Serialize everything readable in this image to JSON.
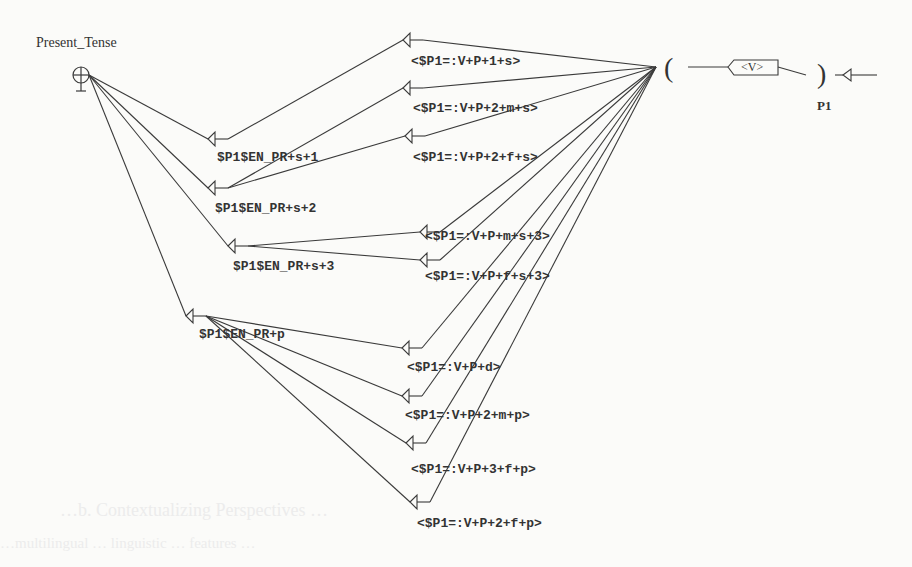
{
  "graph": {
    "title": "Present_Tense",
    "initial_node": {
      "x": 81,
      "y": 75
    },
    "convergence_node": {
      "x": 656,
      "y": 67
    },
    "left_nodes": [
      {
        "id": "s1",
        "label": "$P1$EN_PR+s+1",
        "tip": [
          208,
          139
        ],
        "label_pos": [
          217,
          150
        ]
      },
      {
        "id": "s2",
        "label": "$P1$EN_PR+s+2",
        "tip": [
          208,
          188
        ],
        "label_pos": [
          215,
          201
        ]
      },
      {
        "id": "s3",
        "label": "$P1$EN_PR+s+3",
        "tip": [
          228,
          246
        ],
        "label_pos": [
          233,
          259
        ]
      },
      {
        "id": "p",
        "label": "$P1$EN_PR+p",
        "tip": [
          186,
          316
        ],
        "label_pos": [
          199,
          327
        ]
      }
    ],
    "right_nodes": [
      {
        "id": "r1",
        "label": "<$P1=:V+P+1+s>",
        "from": "s1",
        "tip": [
          403,
          40
        ],
        "label_pos": [
          411,
          54
        ]
      },
      {
        "id": "r2",
        "label": "<$P1=:V+P+2+m+s>",
        "from": "s2",
        "tip": [
          403,
          88
        ],
        "label_pos": [
          413,
          101
        ]
      },
      {
        "id": "r3",
        "label": "<$P1=:V+P+2+f+s>",
        "from": "s2",
        "tip": [
          405,
          136
        ],
        "label_pos": [
          413,
          150
        ]
      },
      {
        "id": "r4",
        "label": "<$P1=:V+P+m+s+3>",
        "from": "s3",
        "tip": [
          420,
          232
        ],
        "label_pos": [
          425,
          229
        ]
      },
      {
        "id": "r5",
        "label": "<$P1=:V+P+f+s+3>",
        "from": "s3",
        "tip": [
          420,
          260
        ],
        "label_pos": [
          425,
          269
        ]
      },
      {
        "id": "r6",
        "label": "<$P1=:V+P+d>",
        "from": "p",
        "tip": [
          402,
          348
        ],
        "label_pos": [
          407,
          360
        ]
      },
      {
        "id": "r7",
        "label": "<$P1=:V+P+2+m+p>",
        "from": "p",
        "tip": [
          402,
          396
        ],
        "label_pos": [
          405,
          408
        ]
      },
      {
        "id": "r8",
        "label": "<$P1=:V+P+3+f+p>",
        "from": "p",
        "tip": [
          406,
          443
        ],
        "label_pos": [
          411,
          462
        ]
      },
      {
        "id": "r9",
        "label": "<$P1=:V+P+2+f+p>",
        "from": "p",
        "tip": [
          410,
          502
        ],
        "label_pos": [
          417,
          516
        ]
      }
    ],
    "subgraph": {
      "open_paren": "(",
      "close_paren": ")",
      "box_label": "<V>",
      "variable_label": "P1",
      "final_arrow": "final-state"
    }
  },
  "background_bleed": [
    "…b. Contextualizing Perspectives …",
    "…multilingual … linguistic … features …"
  ]
}
